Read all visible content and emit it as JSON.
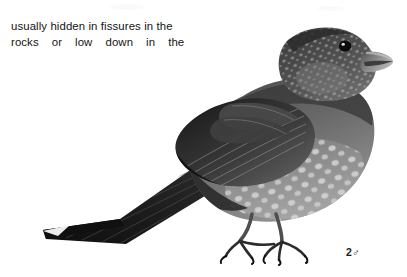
{
  "page": {
    "background_color": "#ffffff",
    "ink_color": "#141414",
    "width": 407,
    "height": 277,
    "kind": "book-plate-scan"
  },
  "body_text": {
    "line1": "usually hidden in fissures in the",
    "line2_words": [
      "rocks",
      "or",
      "low",
      "down",
      "in",
      "the"
    ],
    "line2": "rocks   or   low   down   in   the",
    "justified": true
  },
  "figure": {
    "caption": "2♂",
    "number": "2",
    "sex_symbol": "♂",
    "technique": "graphite / halftone monochrome illustration"
  },
  "illustration": {
    "parts": [
      {
        "name": "beak",
        "tone": "#6e6e6e"
      },
      {
        "name": "eye",
        "tone": "#0d0d0d"
      },
      {
        "name": "head",
        "tone": "#4a4a4a"
      },
      {
        "name": "mantle",
        "tone": "#3e3e3e"
      },
      {
        "name": "wing",
        "tone": "#2a2a2a"
      },
      {
        "name": "breast",
        "tone": "#8a8a8a"
      },
      {
        "name": "belly-spots",
        "tone": "#d8d8d8"
      },
      {
        "name": "tail",
        "tone": "#1e1e1e"
      },
      {
        "name": "legs",
        "tone": "#5a5a5a"
      },
      {
        "name": "claws",
        "tone": "#121212"
      }
    ]
  }
}
